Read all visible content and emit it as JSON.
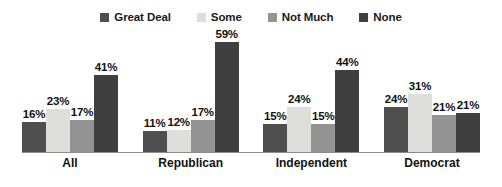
{
  "chart_data": {
    "type": "bar",
    "title": "",
    "subtitle": "",
    "xlabel": "",
    "ylabel": "",
    "ylim": [
      0,
      62
    ],
    "grid": false,
    "legend_position": "top-center",
    "value_suffix": "%",
    "categories": [
      "All",
      "Republican",
      "Independent",
      "Democrat"
    ],
    "series": [
      {
        "name": "Great Deal",
        "color": "#4f4f4f",
        "values": [
          16,
          11,
          15,
          24
        ],
        "labels": [
          "16%",
          "11%",
          "15%",
          "24%"
        ]
      },
      {
        "name": "Some",
        "color": "#dededa",
        "values": [
          23,
          12,
          24,
          31
        ],
        "labels": [
          "23%",
          "12%",
          "24%",
          "31%"
        ]
      },
      {
        "name": "Not Much",
        "color": "#939393",
        "values": [
          17,
          17,
          15,
          20
        ],
        "labels": [
          "17%",
          "17%",
          "15%",
          "21%"
        ]
      },
      {
        "name": "None",
        "color": "#3f3f3f",
        "values": [
          41,
          59,
          44,
          21
        ],
        "labels": [
          "41%",
          "59%",
          "44%",
          "21%"
        ]
      }
    ],
    "axis_color": "#8c8c8c",
    "background": "#ffffff",
    "label_color": "#111111"
  }
}
